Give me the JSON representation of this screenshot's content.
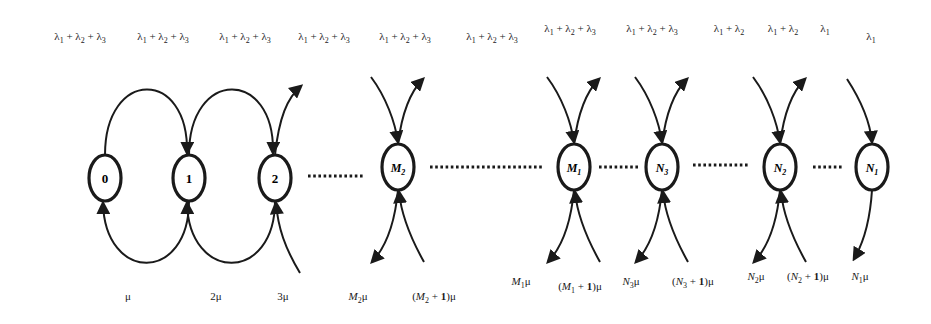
{
  "diagram": {
    "type": "birth-death state transition diagram",
    "nodes": [
      {
        "id": "0",
        "label": "0",
        "x": 105,
        "y": 178
      },
      {
        "id": "1",
        "label": "1",
        "x": 189,
        "y": 178
      },
      {
        "id": "2",
        "label": "2",
        "x": 275,
        "y": 178
      },
      {
        "id": "M2",
        "label": "M",
        "sub": "2",
        "x": 398,
        "y": 167
      },
      {
        "id": "M1",
        "label": "M",
        "sub": "1",
        "x": 574,
        "y": 167
      },
      {
        "id": "N3",
        "label": "N",
        "sub": "3",
        "x": 662,
        "y": 167
      },
      {
        "id": "N2",
        "label": "N",
        "sub": "2",
        "x": 780,
        "y": 167
      },
      {
        "id": "N1",
        "label": "N",
        "sub": "1",
        "x": 872,
        "y": 167
      }
    ],
    "ellipses": [
      {
        "from_x": 308,
        "to_x": 365,
        "y": 176
      },
      {
        "from_x": 430,
        "to_x": 540,
        "y": 167
      },
      {
        "from_x": 599,
        "to_x": 638,
        "y": 167
      },
      {
        "from_x": 693,
        "to_x": 750,
        "y": 165
      },
      {
        "from_x": 813,
        "to_x": 840,
        "y": 167
      }
    ],
    "arrival_labels": [
      {
        "text": "λ1 + λ2 + λ3",
        "parts": [
          [
            "λ",
            "1"
          ],
          [
            "λ",
            "2"
          ],
          [
            "λ",
            "3"
          ]
        ],
        "x": 80,
        "y": 38
      },
      {
        "text": "λ1 + λ2 + λ3",
        "parts": [
          [
            "λ",
            "1"
          ],
          [
            "λ",
            "2"
          ],
          [
            "λ",
            "3"
          ]
        ],
        "x": 163,
        "y": 38
      },
      {
        "text": "λ1 + λ2 + λ3",
        "parts": [
          [
            "λ",
            "1"
          ],
          [
            "λ",
            "2"
          ],
          [
            "λ",
            "3"
          ]
        ],
        "x": 245,
        "y": 38
      },
      {
        "text": "λ1 + λ2 + λ3",
        "parts": [
          [
            "λ",
            "1"
          ],
          [
            "λ",
            "2"
          ],
          [
            "λ",
            "3"
          ]
        ],
        "x": 324,
        "y": 38
      },
      {
        "text": "λ1 + λ2 + λ3",
        "parts": [
          [
            "λ",
            "1"
          ],
          [
            "λ",
            "2"
          ],
          [
            "λ",
            "3"
          ]
        ],
        "x": 405,
        "y": 38
      },
      {
        "text": "λ1 + λ2 + λ3",
        "parts": [
          [
            "λ",
            "1"
          ],
          [
            "λ",
            "2"
          ],
          [
            "λ",
            "3"
          ]
        ],
        "x": 492,
        "y": 38
      },
      {
        "text": "λ1 + λ2 + λ3",
        "parts": [
          [
            "λ",
            "1"
          ],
          [
            "λ",
            "2"
          ],
          [
            "λ",
            "3"
          ]
        ],
        "x": 570,
        "y": 30
      },
      {
        "text": "λ1 + λ2 + λ3",
        "parts": [
          [
            "λ",
            "1"
          ],
          [
            "λ",
            "2"
          ],
          [
            "λ",
            "3"
          ]
        ],
        "x": 652,
        "y": 30
      },
      {
        "text": "λ1 + λ2",
        "parts": [
          [
            "λ",
            "1"
          ],
          [
            "λ",
            "2"
          ]
        ],
        "x": 729,
        "y": 30
      },
      {
        "text": "λ1 + λ2",
        "parts": [
          [
            "λ",
            "1"
          ],
          [
            "λ",
            "2"
          ]
        ],
        "x": 783,
        "y": 30
      },
      {
        "text": "λ1",
        "parts": [
          [
            "λ",
            "1"
          ]
        ],
        "x": 825,
        "y": 30
      },
      {
        "text": "λ1",
        "parts": [
          [
            "λ",
            "1"
          ]
        ],
        "x": 871,
        "y": 38
      }
    ],
    "service_labels": [
      {
        "text": "μ",
        "x": 128,
        "y": 298
      },
      {
        "text": "2μ",
        "x": 216,
        "y": 298
      },
      {
        "text": "3μ",
        "x": 283,
        "y": 298
      },
      {
        "text": "M2μ",
        "var": "M",
        "sub": "2",
        "paren": false,
        "x": 358,
        "y": 298
      },
      {
        "text": "(M2 + 1)μ",
        "var": "M",
        "sub": "2",
        "paren": true,
        "x": 434,
        "y": 298
      },
      {
        "text": "M1μ",
        "var": "M",
        "sub": "1",
        "paren": false,
        "x": 521,
        "y": 283
      },
      {
        "text": "(M1 + 1)μ",
        "var": "M",
        "sub": "1",
        "paren": true,
        "x": 580,
        "y": 288
      },
      {
        "text": "N3μ",
        "var": "N",
        "sub": "3",
        "paren": false,
        "x": 631,
        "y": 283
      },
      {
        "text": "(N3 + 1)μ",
        "var": "N",
        "sub": "3",
        "paren": true,
        "x": 693,
        "y": 283
      },
      {
        "text": "N2μ",
        "var": "N",
        "sub": "2",
        "paren": false,
        "x": 756,
        "y": 278
      },
      {
        "text": "(N2 + 1)μ",
        "var": "N",
        "sub": "2",
        "paren": true,
        "x": 808,
        "y": 278
      },
      {
        "text": "N1μ",
        "var": "N",
        "sub": "1",
        "paren": false,
        "x": 860,
        "y": 278
      }
    ]
  }
}
